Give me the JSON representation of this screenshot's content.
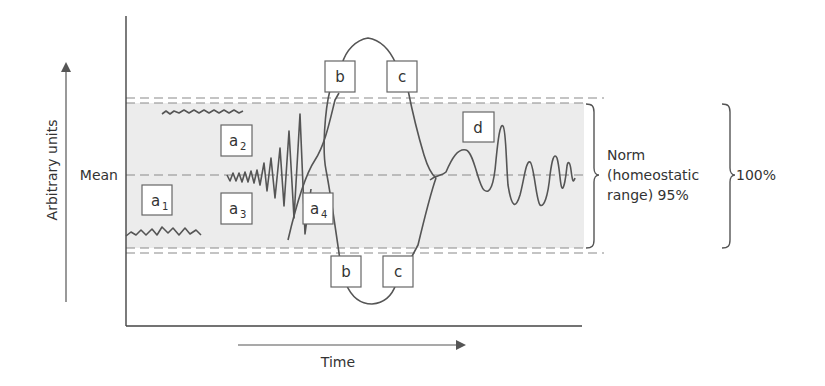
{
  "diagram": {
    "y_axis_label": "Arbitrary units",
    "x_axis_label": "Time",
    "mean_label": "Mean",
    "norm_label_line1": "Norm",
    "norm_label_line2": "(homeostatic",
    "norm_label_line3": "range) 95%",
    "total_label": "100%",
    "boxes": {
      "a1": {
        "letter": "a",
        "sub": "1"
      },
      "a2": {
        "letter": "a",
        "sub": "2"
      },
      "a3": {
        "letter": "a",
        "sub": "3"
      },
      "a4": {
        "letter": "a",
        "sub": "4"
      },
      "b_top": {
        "letter": "b"
      },
      "c_top": {
        "letter": "c"
      },
      "b_bottom": {
        "letter": "b"
      },
      "c_bottom": {
        "letter": "c"
      },
      "d": {
        "letter": "d"
      }
    },
    "colors": {
      "line": "#555555",
      "band": "#ececec",
      "dash": "#8a8a8a"
    }
  }
}
